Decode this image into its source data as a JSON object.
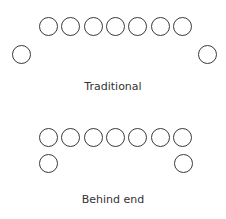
{
  "diagrams": [
    {
      "label": "Traditional",
      "top_row_count": 7,
      "top_row_y": 17,
      "side_circles": [
        {
          "x": 12,
          "y": 45
        },
        {
          "x": 198,
          "y": 45
        }
      ],
      "label_y": 80
    },
    {
      "label": "Behind end",
      "top_row_count": 7,
      "top_row_y": 128,
      "side_circles": [
        {
          "x": 39,
          "y": 154
        },
        {
          "x": 174,
          "y": 154
        }
      ],
      "label_y": 193
    }
  ],
  "style": {
    "stroke_color": "#3a3a3a",
    "text_color": "#333333"
  }
}
